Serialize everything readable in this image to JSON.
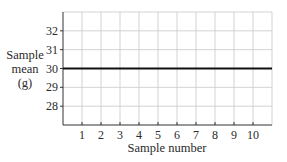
{
  "chart_data": {
    "type": "line",
    "title": "",
    "xlabel": "Sample number",
    "ylabel_lines": [
      "Sample",
      "mean",
      "(g)"
    ],
    "ylabel": "Sample mean (g)",
    "x_ticks": [
      1,
      2,
      3,
      4,
      5,
      6,
      7,
      8,
      9,
      10
    ],
    "y_ticks": [
      28,
      29,
      30,
      31,
      32
    ],
    "xlim": [
      0,
      11
    ],
    "ylim": [
      27,
      33
    ],
    "grid": true,
    "legend": null,
    "series": [
      {
        "name": "Center line (target mean)",
        "x": [
          0,
          11
        ],
        "values": [
          30,
          30
        ],
        "color": "#111111"
      }
    ],
    "colors": {
      "grid": "#c8c8c8",
      "axis": "#333333",
      "line": "#111111"
    }
  }
}
